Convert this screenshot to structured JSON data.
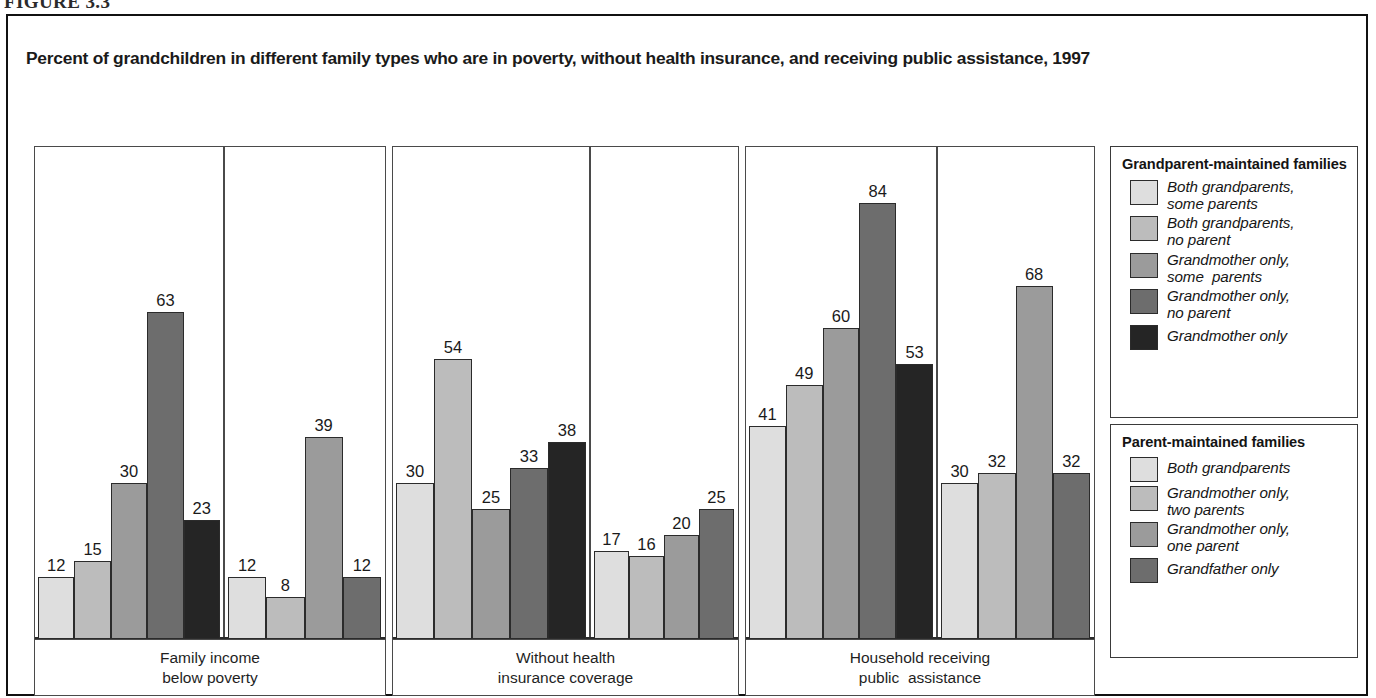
{
  "figure": {
    "number": "FIGURE 3.3",
    "title": "Percent of grandchildren in different family types who are in poverty, without health insurance, and receiving public assistance, 1997"
  },
  "colors": {
    "series": [
      "#dedede",
      "#bcbcbc",
      "#9b9b9b",
      "#6d6d6d",
      "#252525"
    ],
    "frame": "#111111",
    "panel_border": "#4a4a4a",
    "bar_border": "#2b2b2b",
    "text": "#1a1a1a"
  },
  "legends": [
    {
      "heading": "Grandparent-maintained families",
      "items": [
        {
          "label": "Both grandparents, some parents",
          "color_index": 0
        },
        {
          "label": "Both grandparents, no parent",
          "color_index": 1
        },
        {
          "label": "Grandmother only, some  parents",
          "color_index": 2
        },
        {
          "label": "Grandmother only, no parent",
          "color_index": 3
        },
        {
          "label": "Grandmother only",
          "color_index": 4
        }
      ]
    },
    {
      "heading": "Parent-maintained families",
      "items": [
        {
          "label": "Both grandparents",
          "color_index": 0
        },
        {
          "label": "Grandmother only, two parents",
          "color_index": 1
        },
        {
          "label": "Grandmother only, one parent",
          "color_index": 2
        },
        {
          "label": "Grandfather only",
          "color_index": 3
        }
      ]
    }
  ],
  "chart_data": {
    "type": "bar",
    "title": "Percent of grandchildren in different family types who are in poverty, without health insurance, and receiving public assistance, 1997",
    "xlabel": "",
    "ylabel": "Percent",
    "ylim": [
      0,
      90
    ],
    "grid": false,
    "legend_position": "right",
    "categories": [
      "Family income below poverty",
      "Without health insurance coverage",
      "Household receiving public  assistance"
    ],
    "groups": [
      {
        "name": "Grandparent-maintained families",
        "series": [
          {
            "name": "Both grandparents, some parents",
            "values": [
              12,
              30,
              41
            ]
          },
          {
            "name": "Both grandparents, no parent",
            "values": [
              15,
              54,
              49
            ]
          },
          {
            "name": "Grandmother only, some  parents",
            "values": [
              30,
              25,
              60
            ]
          },
          {
            "name": "Grandmother only, no parent",
            "values": [
              63,
              33,
              84
            ]
          },
          {
            "name": "Grandmother only",
            "values": [
              23,
              38,
              53
            ]
          }
        ]
      },
      {
        "name": "Parent-maintained families",
        "series": [
          {
            "name": "Both grandparents",
            "values": [
              12,
              17,
              30
            ]
          },
          {
            "name": "Grandmother only, two parents",
            "values": [
              8,
              16,
              32
            ]
          },
          {
            "name": "Grandmother only, one parent",
            "values": [
              39,
              20,
              68
            ]
          },
          {
            "name": "Grandfather only",
            "values": [
              12,
              25,
              32
            ]
          }
        ]
      }
    ]
  },
  "panels": [
    {
      "caption_line1": "Family income",
      "caption_line2": "below poverty",
      "left_group": [
        {
          "value": 12,
          "color_index": 0
        },
        {
          "value": 15,
          "color_index": 1
        },
        {
          "value": 30,
          "color_index": 2
        },
        {
          "value": 63,
          "color_index": 3
        },
        {
          "value": 23,
          "color_index": 4
        }
      ],
      "right_group": [
        {
          "value": 12,
          "color_index": 0
        },
        {
          "value": 8,
          "color_index": 1
        },
        {
          "value": 39,
          "color_index": 2
        },
        {
          "value": 12,
          "color_index": 3
        }
      ]
    },
    {
      "caption_line1": "Without health",
      "caption_line2": "insurance coverage",
      "left_group": [
        {
          "value": 30,
          "color_index": 0
        },
        {
          "value": 54,
          "color_index": 1
        },
        {
          "value": 25,
          "color_index": 2
        },
        {
          "value": 33,
          "color_index": 3
        },
        {
          "value": 38,
          "color_index": 4
        }
      ],
      "right_group": [
        {
          "value": 17,
          "color_index": 0
        },
        {
          "value": 16,
          "color_index": 1
        },
        {
          "value": 20,
          "color_index": 2
        },
        {
          "value": 25,
          "color_index": 3
        }
      ]
    },
    {
      "caption_line1": "Household receiving",
      "caption_line2": "public  assistance",
      "left_group": [
        {
          "value": 41,
          "color_index": 0
        },
        {
          "value": 49,
          "color_index": 1
        },
        {
          "value": 60,
          "color_index": 2
        },
        {
          "value": 84,
          "color_index": 3
        },
        {
          "value": 53,
          "color_index": 4
        }
      ],
      "right_group": [
        {
          "value": 30,
          "color_index": 0
        },
        {
          "value": 32,
          "color_index": 1
        },
        {
          "value": 68,
          "color_index": 2
        },
        {
          "value": 32,
          "color_index": 3
        }
      ]
    }
  ]
}
